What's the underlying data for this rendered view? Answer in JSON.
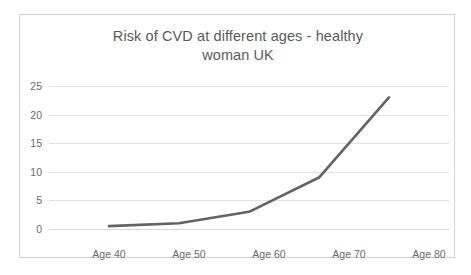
{
  "chart_data": {
    "type": "line",
    "title": "Risk of CVD at different ages - healthy woman UK",
    "title_line_1": "Risk of CVD at different ages - healthy",
    "title_line_2": "woman UK",
    "xlabel": "",
    "ylabel": "",
    "categories": [
      "Age 40",
      "Age 50",
      "Age 60",
      "Age 70",
      "Age 80"
    ],
    "values": [
      0.5,
      1,
      3,
      9,
      23
    ],
    "series": [
      {
        "name": "Risk of CVD",
        "values": [
          0.5,
          1,
          3,
          9,
          23
        ]
      }
    ],
    "ylim": [
      0,
      25
    ],
    "yticks": [
      0,
      5,
      10,
      15,
      20,
      25
    ],
    "ytick_labels": [
      "0",
      "5",
      "10",
      "15",
      "20",
      "25"
    ],
    "grid": "horizontal",
    "legend": "none",
    "line_color": "#636363",
    "grid_color": "#e2e2e2",
    "text_color": "#5a5a5a",
    "border_color": "#d2d2d2"
  }
}
